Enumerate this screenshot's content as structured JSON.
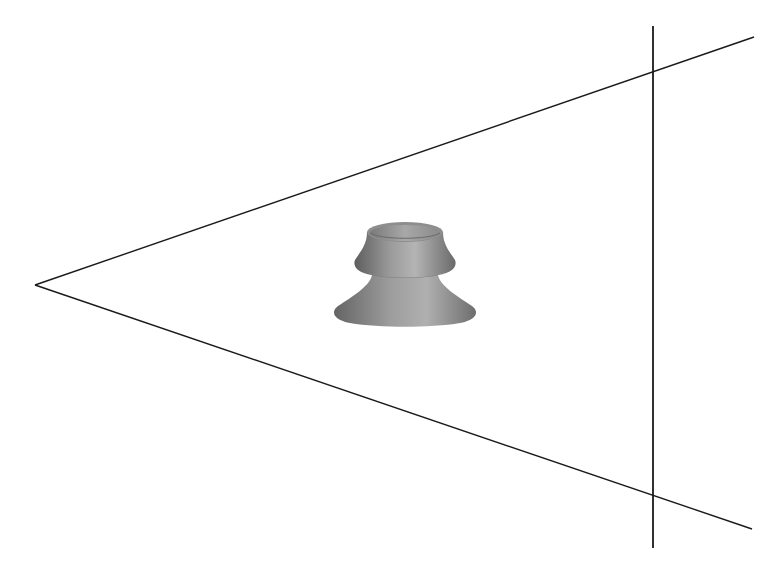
{
  "figure": {
    "background": "#ffffff",
    "line_color": "#1a1a1a",
    "apex": {
      "x": 35,
      "y": 285
    },
    "upper_ray_end": {
      "x": 754,
      "y": 37
    },
    "lower_ray_end": {
      "x": 752,
      "y": 529
    },
    "image_plane": {
      "x": 653,
      "y1": 26,
      "y2": 548
    },
    "intersections": [
      {
        "x": 653,
        "y": 72
      },
      {
        "x": 653,
        "y": 496
      }
    ],
    "object": {
      "name": "suction-cup-shaped solid",
      "color_mid": "#8c8c8c",
      "color_light": "#bdbdbd",
      "color_dark": "#5a5a5a",
      "center_x": 405
    }
  }
}
